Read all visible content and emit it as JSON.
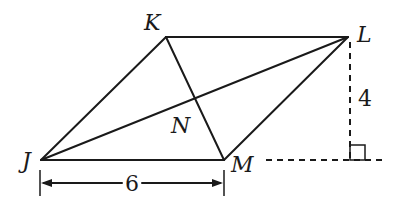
{
  "diagram": {
    "type": "geometry",
    "shape": "rhombus",
    "vertices": {
      "K": {
        "label": "K",
        "x": 166,
        "y": 37
      },
      "L": {
        "label": "L",
        "x": 348,
        "y": 37
      },
      "M": {
        "label": "M",
        "x": 224,
        "y": 160
      },
      "J": {
        "label": "J",
        "x": 41,
        "y": 160
      }
    },
    "intersection": {
      "label": "N"
    },
    "diagonals": [
      "JL",
      "KM"
    ],
    "measurements": {
      "base_length": "6",
      "height": "4"
    },
    "annotations": {
      "right_angle_marker": "right-angle",
      "height_line": "dashed perpendicular from L to extension of JM",
      "base_extension": "dashed extension of JM beyond M"
    },
    "colors": {
      "stroke": "#1a1a1a",
      "background": "#ffffff"
    }
  }
}
